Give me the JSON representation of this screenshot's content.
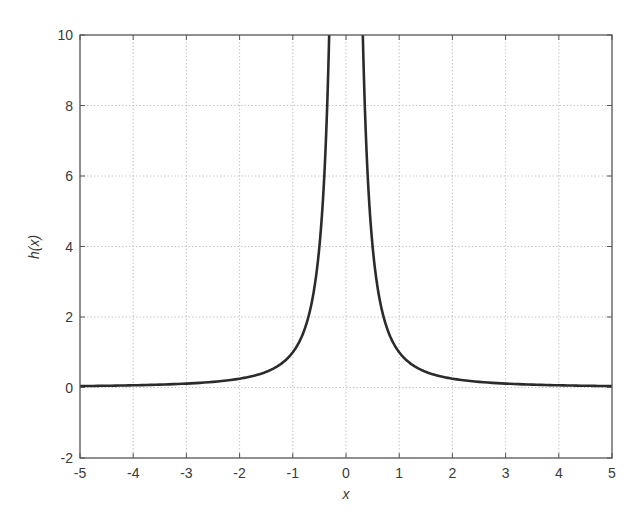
{
  "chart_data": {
    "type": "line",
    "title": "",
    "xlabel": "x",
    "ylabel": "h(x)",
    "xlim": [
      -5,
      5
    ],
    "ylim": [
      -2,
      10
    ],
    "xticks": [
      -5,
      -4,
      -3,
      -2,
      -1,
      0,
      1,
      2,
      3,
      4,
      5
    ],
    "yticks": [
      -2,
      0,
      2,
      4,
      6,
      8,
      10
    ],
    "grid": true,
    "legend": null,
    "function": "h(x) = 1/x^2",
    "series": [
      {
        "name": "h(x)",
        "color": "#2b2b2b",
        "x": [
          -5,
          -4,
          -3,
          -2,
          -1.5,
          -1,
          -0.8,
          -0.7071,
          -0.6,
          -0.5,
          -0.45,
          -0.4,
          -0.35,
          -0.316,
          0.316,
          0.35,
          0.4,
          0.45,
          0.5,
          0.6,
          0.7071,
          0.8,
          1,
          1.5,
          2,
          3,
          4,
          5
        ],
        "y": [
          0.04,
          0.0625,
          0.111,
          0.25,
          0.444,
          1,
          1.5625,
          2,
          2.778,
          4,
          4.938,
          6.25,
          8.163,
          10,
          10,
          8.163,
          6.25,
          4.938,
          4,
          2.778,
          2,
          1.5625,
          1,
          0.444,
          0.25,
          0.111,
          0.0625,
          0.04
        ]
      }
    ]
  },
  "colors": {
    "curve": "#2b2b2b",
    "grid": "#b8b8b8",
    "frame": "#555555",
    "text": "#3a3a3a",
    "background": "#ffffff"
  }
}
